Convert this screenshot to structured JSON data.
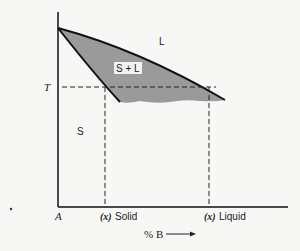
{
  "diagram": {
    "type": "binary-phase-diagram",
    "regions": {
      "liquid": "L",
      "two_phase": "S + L",
      "solid": "S"
    },
    "y_axis": {
      "temperature_label": "T"
    },
    "x_axis": {
      "origin_label": "A",
      "label": "% B",
      "arrow": "→",
      "tick_solid_prefix": "(x)",
      "tick_solid_label": "Solid",
      "tick_liquid_prefix": "(x)",
      "tick_liquid_label": "Liquid"
    },
    "colors": {
      "two_phase_fill": "#9a9a9a",
      "line": "#111111",
      "background": "#f7f7f5"
    }
  }
}
